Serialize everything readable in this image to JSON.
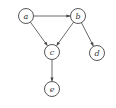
{
  "diagram": {
    "type": "directed-graph",
    "nodes": [
      {
        "id": "a",
        "label": "a",
        "x": 26,
        "y": 16
      },
      {
        "id": "b",
        "label": "b",
        "x": 78,
        "y": 16
      },
      {
        "id": "c",
        "label": "c",
        "x": 52,
        "y": 52
      },
      {
        "id": "d",
        "label": "d",
        "x": 97,
        "y": 53
      },
      {
        "id": "e",
        "label": "e",
        "x": 52,
        "y": 89
      }
    ],
    "edges": [
      {
        "from": "a",
        "to": "b"
      },
      {
        "from": "a",
        "to": "c"
      },
      {
        "from": "b",
        "to": "c"
      },
      {
        "from": "b",
        "to": "d"
      },
      {
        "from": "c",
        "to": "e"
      }
    ],
    "node_radius": 7.5,
    "colors": {
      "stroke": "#444444",
      "fill": "#ffffff",
      "background": "#ffffff"
    }
  }
}
